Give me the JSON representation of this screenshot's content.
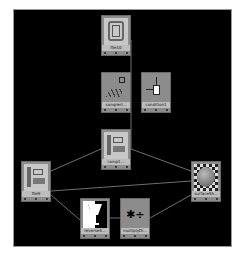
{
  "editor": {
    "background": "#000000",
    "wire_color": "#8a8a8a"
  },
  "nodes": [
    {
      "id": "file10",
      "label": "file10",
      "x": 101,
      "y": 15,
      "thumb": "file-texture"
    },
    {
      "id": "sampler",
      "label": "samplerI...",
      "x": 101,
      "y": 72,
      "thumb": "sampler-info"
    },
    {
      "id": "condition",
      "label": "condition1",
      "x": 141,
      "y": 72,
      "thumb": "condition"
    },
    {
      "id": "ramp",
      "label": "ramp1...",
      "x": 101,
      "y": 129,
      "thumb": "file-texture"
    },
    {
      "id": "file9",
      "label": "file9",
      "x": 21,
      "y": 161,
      "thumb": "file-texture"
    },
    {
      "id": "surface",
      "label": "surfaceSh...",
      "x": 191,
      "y": 161,
      "thumb": "checker-sphere"
    },
    {
      "id": "reverse",
      "label": "reverse4...",
      "x": 80,
      "y": 198,
      "thumb": "reverse"
    },
    {
      "id": "multiply",
      "label": "multiplyDi...",
      "x": 120,
      "y": 198,
      "thumb": "multiply-divide"
    }
  ],
  "connections": [
    {
      "from": "file10",
      "to": "ramp"
    },
    {
      "from": "file9",
      "to": "ramp"
    },
    {
      "from": "ramp",
      "to": "surface"
    },
    {
      "from": "file9",
      "to": "surface"
    },
    {
      "from": "file9",
      "to": "reverse"
    },
    {
      "from": "reverse",
      "to": "multiply"
    },
    {
      "from": "multiply",
      "to": "surface"
    }
  ]
}
